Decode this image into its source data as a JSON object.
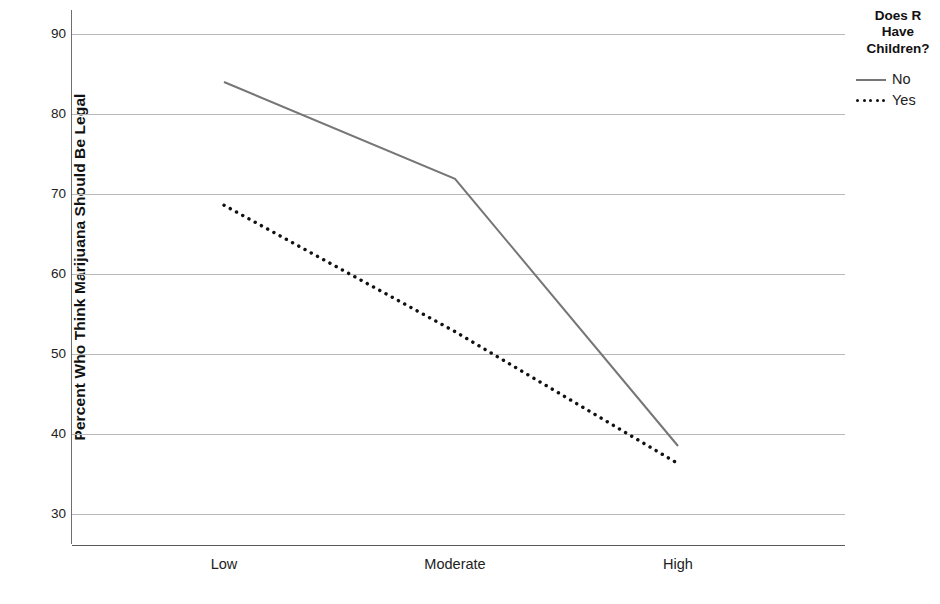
{
  "chart_data": {
    "type": "line",
    "title": "",
    "xlabel": "",
    "ylabel": "Percent Who Think Marijuana Should Be Legal",
    "categories": [
      "Low",
      "Moderate",
      "High"
    ],
    "yticks": [
      30,
      40,
      50,
      60,
      70,
      80,
      90
    ],
    "ylim": [
      26,
      92
    ],
    "grid": true,
    "legend_position": "right",
    "legend_title": "Does R\nHave\nChildren?",
    "series": [
      {
        "name": "No",
        "style": "solid",
        "color": "#767676",
        "values": [
          84.0,
          71.9,
          38.5
        ]
      },
      {
        "name": "Yes",
        "style": "dotted",
        "color": "#111111",
        "values": [
          68.6,
          52.8,
          36.3
        ]
      }
    ]
  },
  "axis": {
    "y_title": "Percent Who Think Marijuana Should Be Legal",
    "y_tick_labels": [
      "90",
      "80",
      "70",
      "60",
      "50",
      "40",
      "30"
    ],
    "x_tick_labels": [
      "Low",
      "Moderate",
      "High"
    ]
  },
  "legend": {
    "title": "Does R\nHave\nChildren?",
    "items": [
      {
        "label": "No",
        "style": "solid"
      },
      {
        "label": "Yes",
        "style": "dotted"
      }
    ]
  }
}
